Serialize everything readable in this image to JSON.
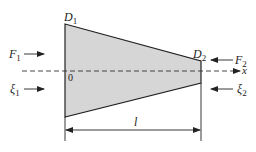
{
  "diagram": {
    "type": "tapered-bar",
    "fill_color": "#d6d6d6",
    "stroke_color": "#222222",
    "labels": {
      "D1": {
        "main": "D",
        "sub": "1"
      },
      "D2": {
        "main": "D",
        "sub": "2"
      },
      "F1": {
        "main": "F",
        "sub": "1"
      },
      "F2": {
        "main": "F",
        "sub": "2"
      },
      "xi1": {
        "main": "ξ",
        "sub": "1"
      },
      "xi2": {
        "main": "ξ",
        "sub": "2"
      },
      "origin": "0",
      "axis": "x",
      "length": "l"
    }
  }
}
